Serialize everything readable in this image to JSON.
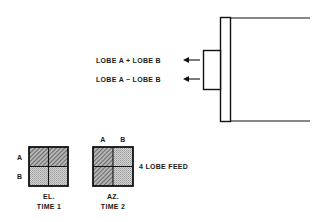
{
  "diagram": {
    "feed_outputs": [
      {
        "label": "LOBE A + LOBE B",
        "direction": "left-arrow"
      },
      {
        "label": "LOBE A − LOBE B",
        "direction": "left-arrow"
      }
    ],
    "feed_name": "4 LOBE FEED",
    "el_grid": {
      "row_labels": [
        "A",
        "B"
      ],
      "caption_line1": "EL.",
      "caption_line2": "TIME 1",
      "hatched": "top-row",
      "dotted": "bottom-row"
    },
    "az_grid": {
      "col_labels": [
        "A",
        "B"
      ],
      "caption_line1": "AZ.",
      "caption_line2": "TIME 2",
      "hatched": "left-column",
      "dotted": "right-column"
    },
    "colors": {
      "line": "#111111",
      "hatch_fill": "#9a9a9a",
      "dot_fill": "#c8c8c8"
    }
  }
}
